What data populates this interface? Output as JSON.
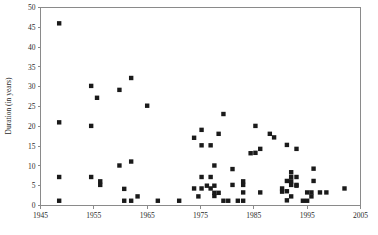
{
  "chart_data": {
    "type": "scatter",
    "title": "",
    "xlabel": "",
    "ylabel": "Duration (in years)",
    "xlim": [
      1945,
      2005
    ],
    "ylim": [
      0,
      50
    ],
    "xticks": [
      1945,
      1955,
      1965,
      1975,
      1985,
      1995,
      2005
    ],
    "yticks": [
      0,
      5,
      10,
      15,
      20,
      25,
      30,
      35,
      40,
      45,
      50
    ],
    "xtick_labels": [
      "1945",
      "1955",
      "1965",
      "1975",
      "1985",
      "1995",
      "2005"
    ],
    "ytick_labels": [
      "0",
      "5",
      "10",
      "15",
      "20",
      "25",
      "30",
      "35",
      "40",
      "45",
      "50"
    ],
    "grid": false,
    "legend": null,
    "marker": "square",
    "marker_color": "#1a1a1a",
    "marker_size": 2.2,
    "series": [
      {
        "name": "Duration",
        "points": [
          [
            1948.5,
            46.0
          ],
          [
            1948.5,
            21.0
          ],
          [
            1948.5,
            7.2
          ],
          [
            1948.5,
            1.2
          ],
          [
            1954.5,
            30.2
          ],
          [
            1954.5,
            20.1
          ],
          [
            1954.5,
            7.2
          ],
          [
            1955.6,
            27.2
          ],
          [
            1956.2,
            6.1
          ],
          [
            1956.2,
            5.2
          ],
          [
            1959.8,
            29.2
          ],
          [
            1959.8,
            10.1
          ],
          [
            1960.7,
            4.2
          ],
          [
            1960.7,
            1.2
          ],
          [
            1962.0,
            32.2
          ],
          [
            1962.0,
            11.1
          ],
          [
            1962.0,
            1.2
          ],
          [
            1963.2,
            2.3
          ],
          [
            1965.0,
            25.2
          ],
          [
            1967.0,
            1.2
          ],
          [
            1971.0,
            1.2
          ],
          [
            1973.8,
            17.1
          ],
          [
            1973.8,
            4.3
          ],
          [
            1974.6,
            2.3
          ],
          [
            1975.2,
            19.1
          ],
          [
            1975.2,
            15.2
          ],
          [
            1975.2,
            7.2
          ],
          [
            1975.2,
            4.3
          ],
          [
            1976.2,
            5.0
          ],
          [
            1976.9,
            15.2
          ],
          [
            1976.9,
            7.2
          ],
          [
            1976.9,
            4.3
          ],
          [
            1977.6,
            10.1
          ],
          [
            1977.6,
            5.0
          ],
          [
            1977.6,
            3.2
          ],
          [
            1977.6,
            2.4
          ],
          [
            1978.4,
            18.1
          ],
          [
            1978.4,
            3.2
          ],
          [
            1979.3,
            23.1
          ],
          [
            1979.3,
            1.2
          ],
          [
            1980.2,
            1.2
          ],
          [
            1981.0,
            9.2
          ],
          [
            1981.0,
            5.2
          ],
          [
            1982.0,
            1.2
          ],
          [
            1983.0,
            6.1
          ],
          [
            1983.0,
            5.2
          ],
          [
            1983.0,
            3.3
          ],
          [
            1983.0,
            1.2
          ],
          [
            1984.4,
            13.2
          ],
          [
            1985.3,
            20.1
          ],
          [
            1985.3,
            13.3
          ],
          [
            1986.2,
            14.3
          ],
          [
            1986.2,
            3.3
          ],
          [
            1988.0,
            18.1
          ],
          [
            1988.8,
            17.2
          ],
          [
            1990.3,
            4.3
          ],
          [
            1990.3,
            3.5
          ],
          [
            1991.2,
            15.3
          ],
          [
            1991.2,
            6.2
          ],
          [
            1991.2,
            3.6
          ],
          [
            1991.2,
            1.3
          ],
          [
            1992.0,
            8.4
          ],
          [
            1992.0,
            7.2
          ],
          [
            1992.0,
            6.1
          ],
          [
            1992.0,
            5.2
          ],
          [
            1992.0,
            2.3
          ],
          [
            1993.0,
            14.3
          ],
          [
            1993.0,
            7.2
          ],
          [
            1993.0,
            5.2
          ],
          [
            1993.0,
            5.0
          ],
          [
            1994.2,
            1.2
          ],
          [
            1995.0,
            3.3
          ],
          [
            1995.0,
            1.2
          ],
          [
            1995.8,
            3.3
          ],
          [
            1995.8,
            2.3
          ],
          [
            1996.2,
            9.3
          ],
          [
            1996.2,
            6.2
          ],
          [
            1997.4,
            3.3
          ],
          [
            1998.6,
            3.3
          ],
          [
            2002.0,
            4.3
          ]
        ]
      }
    ]
  }
}
